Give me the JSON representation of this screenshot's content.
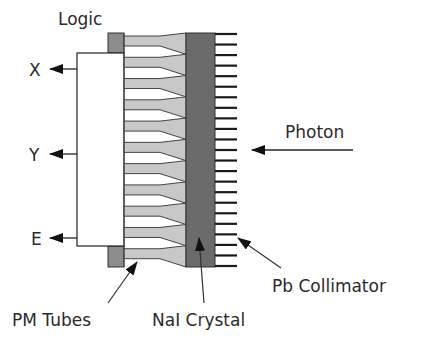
{
  "diagram": {
    "type": "gamma-camera-schematic",
    "labels": {
      "logic": "Logic",
      "x_output": "X",
      "y_output": "Y",
      "e_output": "E",
      "photon": "Photon",
      "pm_tubes": "PM Tubes",
      "nai_crystal": "NaI Crystal",
      "pb_collimator": "Pb Collimator"
    },
    "components": {
      "pm_tube_count": 11,
      "collimator_fin_count": 23
    },
    "colors": {
      "crystal": "#6b6b6b",
      "logic_block": "#8c8c8c",
      "pm_tube": "#c8c8c8",
      "line": "#1a1a1a",
      "background": "#ffffff"
    }
  }
}
